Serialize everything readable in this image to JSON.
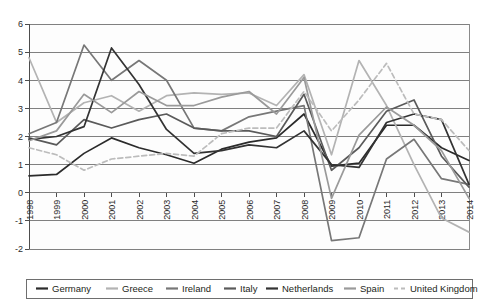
{
  "chart_data": {
    "type": "line",
    "title": "",
    "xlabel": "",
    "ylabel": "",
    "x": [
      1998,
      1999,
      2000,
      2001,
      2002,
      2003,
      2004,
      2005,
      2006,
      2007,
      2008,
      2009,
      2010,
      2011,
      2012,
      2013,
      2014
    ],
    "xtick_labels": [
      "1998",
      "1999",
      "2000",
      "2001",
      "2002",
      "2003",
      "2004",
      "2005",
      "2006",
      "2007",
      "2008",
      "2009",
      "2010",
      "2011",
      "2012",
      "2013",
      "2014"
    ],
    "ytick_labels": [
      "6",
      "5",
      "4",
      "3",
      "2",
      "1",
      "0",
      "-1",
      "-2"
    ],
    "yticks": [
      6,
      5,
      4,
      3,
      2,
      1,
      0,
      -1,
      -2
    ],
    "ylim": [
      -2,
      6
    ],
    "grid": true,
    "legend_position": "bottom",
    "series": [
      {
        "name": "Germany",
        "color": "#2b2b2b",
        "dash": "none",
        "values": [
          0.6,
          0.65,
          1.4,
          1.95,
          1.6,
          1.35,
          1.05,
          1.55,
          1.8,
          1.95,
          2.8,
          0.95,
          1.05,
          2.4,
          2.4,
          1.6,
          1.15
        ]
      },
      {
        "name": "Greece",
        "color": "#b3b3b3",
        "dash": "none",
        "values": [
          4.8,
          2.5,
          3.2,
          3.45,
          2.9,
          3.45,
          3.55,
          3.5,
          3.55,
          3.1,
          4.2,
          1.35,
          4.7,
          3.1,
          1.0,
          -0.9,
          -1.4
        ]
      },
      {
        "name": "Ireland",
        "color": "#777777",
        "dash": "none",
        "values": [
          2.1,
          2.5,
          5.25,
          4.0,
          4.7,
          4.0,
          2.3,
          2.2,
          2.7,
          2.9,
          3.1,
          -1.7,
          -1.6,
          1.2,
          1.9,
          0.5,
          0.3
        ]
      },
      {
        "name": "Italy",
        "color": "#5a5a5a",
        "dash": "none",
        "values": [
          1.95,
          1.7,
          2.6,
          2.3,
          2.6,
          2.8,
          2.3,
          2.2,
          2.2,
          2.0,
          3.5,
          0.8,
          1.6,
          2.9,
          3.3,
          1.3,
          0.2
        ]
      },
      {
        "name": "Netherlands",
        "color": "#333333",
        "dash": "none",
        "values": [
          1.9,
          2.0,
          2.35,
          5.15,
          3.85,
          2.25,
          1.4,
          1.5,
          1.7,
          1.6,
          2.2,
          1.0,
          0.9,
          2.5,
          2.8,
          2.6,
          0.3
        ]
      },
      {
        "name": "Spain",
        "color": "#9a9a9a",
        "dash": "none",
        "values": [
          1.85,
          2.2,
          3.5,
          2.85,
          3.6,
          3.1,
          3.1,
          3.4,
          3.6,
          2.8,
          4.1,
          -0.2,
          2.05,
          3.05,
          2.4,
          1.5,
          -0.2
        ]
      },
      {
        "name": "United Kingdom",
        "color": "#bcbcbc",
        "dash": "dashed",
        "values": [
          1.6,
          1.35,
          0.8,
          1.2,
          1.3,
          1.4,
          1.3,
          2.1,
          2.3,
          2.3,
          3.6,
          2.2,
          3.3,
          4.6,
          2.8,
          2.6,
          1.5
        ]
      }
    ]
  },
  "legend": {
    "items": [
      {
        "label": "Germany"
      },
      {
        "label": "Greece"
      },
      {
        "label": "Ireland"
      },
      {
        "label": "Italy"
      },
      {
        "label": "Netherlands"
      },
      {
        "label": "Spain"
      },
      {
        "label": "United Kingdom"
      }
    ]
  },
  "axes": {
    "y_ticks": [
      "6",
      "5",
      "4",
      "3",
      "2",
      "1",
      "0",
      "-1",
      "-2"
    ],
    "x_ticks": [
      "1998",
      "1999",
      "2000",
      "2001",
      "2002",
      "2003",
      "2004",
      "2005",
      "2006",
      "2007",
      "2008",
      "2009",
      "2010",
      "2011",
      "2012",
      "2013",
      "2014"
    ]
  }
}
